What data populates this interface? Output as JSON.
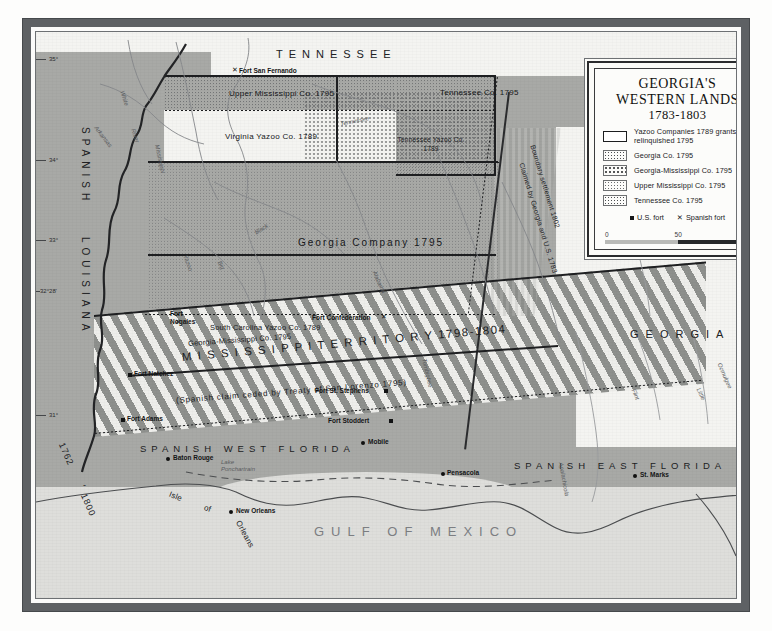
{
  "legend": {
    "title_line1": "GEORGIA'S",
    "title_line2": "WESTERN  LANDS",
    "date_range": "1783-1803",
    "entries": [
      {
        "label": "Yazoo Companies 1789 grants relinquished 1795",
        "swatch": "open-rectangle"
      },
      {
        "label": "Georgia Co. 1795",
        "swatch": "dot-dense"
      },
      {
        "label": "Georgia-Mississippi Co. 1795",
        "swatch": "dot-mid"
      },
      {
        "label": "Upper Mississippi Co. 1795",
        "swatch": "dot-fine"
      },
      {
        "label": "Tennessee Co. 1795",
        "swatch": "dot-dense"
      }
    ],
    "fort_us_label": "U.S. fort",
    "fort_us_icon": "filled-square-icon",
    "fort_spanish_label": "Spanish fort",
    "fort_spanish_icon": "x-cross-icon",
    "scale": {
      "min": "0",
      "mid": "50",
      "max": "100"
    }
  },
  "map": {
    "states": [
      {
        "name": "TENNESSEE"
      },
      {
        "name": "SPANISH"
      },
      {
        "name": "LOUISIANA"
      },
      {
        "name": "GEORGIA"
      },
      {
        "name": "SPANISH WEST FLORIDA"
      },
      {
        "name": "SPANISH EAST FLORIDA"
      },
      {
        "name": "GULF OF MEXICO"
      }
    ],
    "territory_band": "M I S S I S S I P P I    T E R R I T O R Y    1798-1804",
    "treaty_note": "(Spanish   claim   ceded   by   Treaty   of   San Lorenzo   1795)",
    "companies": [
      {
        "name": "Upper Mississippi Co. 1795"
      },
      {
        "name": "Virginia Yazoo Co. 1789"
      },
      {
        "name": "Tennessee Co.   1795"
      },
      {
        "name": "Tennessee Yazoo Co. 1789"
      },
      {
        "name": "Georgia   Company   1795"
      },
      {
        "name": "South Carolina Yazoo Co. 1789"
      },
      {
        "name": "Georgia-Mississippi Co. 1795"
      }
    ],
    "boundary_notes": [
      {
        "text": "Boundary settlement 1802"
      },
      {
        "text": "Claimed by Georgia and U.S. 1783"
      }
    ],
    "forts": [
      {
        "name": "Fort San Fernando",
        "type": "spanish"
      },
      {
        "name": "Fort Nogales",
        "type": "spanish"
      },
      {
        "name": "Fort Confederation",
        "type": "spanish"
      },
      {
        "name": "Fort Natchez",
        "type": "us"
      },
      {
        "name": "Fort St. Stephens",
        "type": "us"
      },
      {
        "name": "Fort Adams",
        "type": "us"
      },
      {
        "name": "Fort Stoddert",
        "type": "us"
      }
    ],
    "cities": [
      {
        "name": "Baton Rouge"
      },
      {
        "name": "New Orleans"
      },
      {
        "name": "Mobile"
      },
      {
        "name": "Pensacola"
      },
      {
        "name": "St. Marks"
      }
    ],
    "features": [
      {
        "name": "Lake Ponchartrain"
      },
      {
        "name": "Isle"
      },
      {
        "name": "of"
      },
      {
        "name": "Orleans"
      }
    ],
    "rivers": [
      {
        "name": "White"
      },
      {
        "name": "River"
      },
      {
        "name": "Arkansas"
      },
      {
        "name": "Mississippi"
      },
      {
        "name": "Tennessee"
      },
      {
        "name": "Black"
      },
      {
        "name": "Big"
      },
      {
        "name": "Yazoo"
      },
      {
        "name": "Tombigbee"
      },
      {
        "name": "Alabama"
      },
      {
        "name": "Flint"
      },
      {
        "name": "Little"
      },
      {
        "name": "Ocmulgee"
      },
      {
        "name": "Apalachicola"
      }
    ],
    "latitudes": [
      {
        "value": "35°"
      },
      {
        "value": "34°"
      },
      {
        "value": "33°"
      },
      {
        "value": "32°28'"
      },
      {
        "value": "31°"
      }
    ],
    "date_left": {
      "top": "1762",
      "dash": "-",
      "bottom": "1800"
    }
  },
  "colors": {
    "land": "#a8a9a6",
    "water": "#dededb",
    "paper": "#f4f4f1",
    "frame": "#5e6164",
    "ink": "#1c1d1f"
  }
}
